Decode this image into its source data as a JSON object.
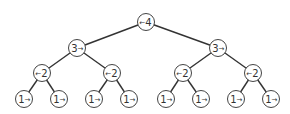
{
  "diagram": {
    "type": "binary-tree",
    "nodes": [
      {
        "id": "n0",
        "value": "4",
        "arrow": "left",
        "x": 146,
        "y": 22
      },
      {
        "id": "n1",
        "value": "3",
        "arrow": "right",
        "x": 77,
        "y": 48
      },
      {
        "id": "n2",
        "value": "3",
        "arrow": "right",
        "x": 218,
        "y": 48
      },
      {
        "id": "n3",
        "value": "2",
        "arrow": "left",
        "x": 42,
        "y": 73
      },
      {
        "id": "n4",
        "value": "2",
        "arrow": "left",
        "x": 112,
        "y": 73
      },
      {
        "id": "n5",
        "value": "2",
        "arrow": "left",
        "x": 183,
        "y": 73
      },
      {
        "id": "n6",
        "value": "2",
        "arrow": "left",
        "x": 253,
        "y": 73
      },
      {
        "id": "n7",
        "value": "1",
        "arrow": "right",
        "x": 24,
        "y": 99
      },
      {
        "id": "n8",
        "value": "1",
        "arrow": "right",
        "x": 59,
        "y": 99
      },
      {
        "id": "n9",
        "value": "1",
        "arrow": "right",
        "x": 94,
        "y": 99
      },
      {
        "id": "n10",
        "value": "1",
        "arrow": "right",
        "x": 129,
        "y": 99
      },
      {
        "id": "n11",
        "value": "1",
        "arrow": "right",
        "x": 166,
        "y": 99
      },
      {
        "id": "n12",
        "value": "1",
        "arrow": "right",
        "x": 201,
        "y": 99
      },
      {
        "id": "n13",
        "value": "1",
        "arrow": "right",
        "x": 236,
        "y": 99
      },
      {
        "id": "n14",
        "value": "1",
        "arrow": "right",
        "x": 271,
        "y": 99
      }
    ],
    "edges": [
      [
        "n0",
        "n1"
      ],
      [
        "n0",
        "n2"
      ],
      [
        "n1",
        "n3"
      ],
      [
        "n1",
        "n4"
      ],
      [
        "n2",
        "n5"
      ],
      [
        "n2",
        "n6"
      ],
      [
        "n3",
        "n7"
      ],
      [
        "n3",
        "n8"
      ],
      [
        "n4",
        "n9"
      ],
      [
        "n4",
        "n10"
      ],
      [
        "n5",
        "n11"
      ],
      [
        "n5",
        "n12"
      ],
      [
        "n6",
        "n13"
      ],
      [
        "n6",
        "n14"
      ]
    ],
    "node_radius": 8.5,
    "arrow_glyphs": {
      "left": "←",
      "right": "→"
    },
    "colors": {
      "edge": "#333333",
      "node_stroke": "#444444",
      "node_fill": "#ffffff",
      "text": "#333333"
    }
  }
}
